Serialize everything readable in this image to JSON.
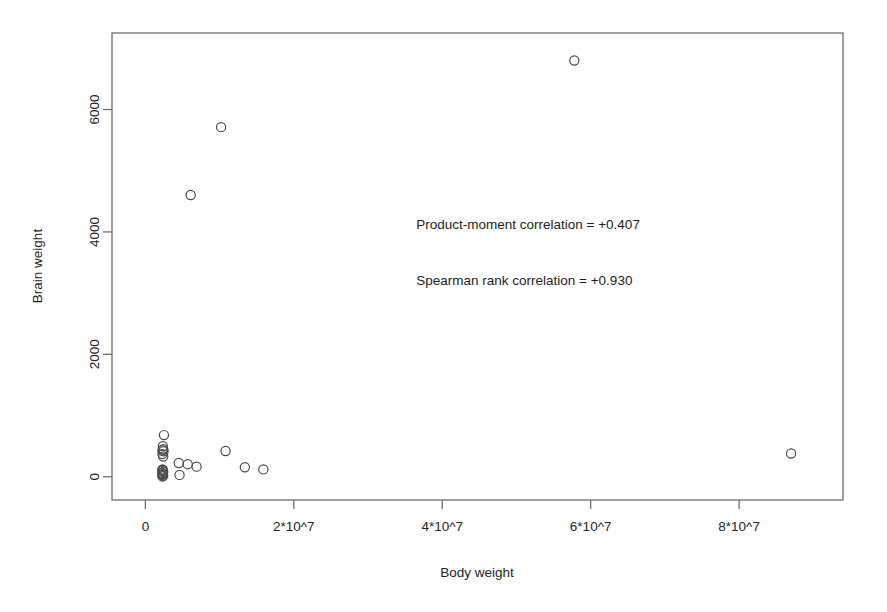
{
  "chart_data": {
    "type": "scatter",
    "title": "",
    "xlabel": "Body weight",
    "ylabel": "Brain weight",
    "xlim": [
      -4500000,
      94000000
    ],
    "ylim": [
      -380,
      7250
    ],
    "grid": false,
    "legend": null,
    "marker": {
      "shape": "open-circle",
      "radius_px": 4.6,
      "stroke": "#4a4a4a",
      "fill": "none",
      "stroke_width": 1.2
    },
    "xticks": [
      {
        "value": 0,
        "label": "0"
      },
      {
        "value": 20000000,
        "label": "2*10^7"
      },
      {
        "value": 40000000,
        "label": "4*10^7"
      },
      {
        "value": 60000000,
        "label": "6*10^7"
      },
      {
        "value": 80000000,
        "label": "8*10^7"
      }
    ],
    "yticks": [
      {
        "value": 0,
        "label": "0"
      },
      {
        "value": 2000,
        "label": "2000"
      },
      {
        "value": 4000,
        "label": "4000"
      },
      {
        "value": 6000,
        "label": "6000"
      }
    ],
    "annotations": [
      {
        "text": "Product-moment correlation = +0.407",
        "x": 36500000,
        "y": 4050,
        "anchor": "start"
      },
      {
        "text": "Spearman rank correlation = +0.930",
        "x": 36500000,
        "y": 3140,
        "anchor": "start"
      }
    ],
    "points": [
      {
        "x": 57800000,
        "y": 6800
      },
      {
        "x": 10200000,
        "y": 5712
      },
      {
        "x": 6100000,
        "y": 4603
      },
      {
        "x": 2500000,
        "y": 680
      },
      {
        "x": 2350000,
        "y": 500
      },
      {
        "x": 2400000,
        "y": 450
      },
      {
        "x": 2300000,
        "y": 430
      },
      {
        "x": 2450000,
        "y": 415
      },
      {
        "x": 2300000,
        "y": 370
      },
      {
        "x": 2400000,
        "y": 330
      },
      {
        "x": 2300000,
        "y": 120
      },
      {
        "x": 2350000,
        "y": 110
      },
      {
        "x": 2300000,
        "y": 95
      },
      {
        "x": 2400000,
        "y": 80
      },
      {
        "x": 2300000,
        "y": 60
      },
      {
        "x": 2350000,
        "y": 45
      },
      {
        "x": 2300000,
        "y": 30
      },
      {
        "x": 2400000,
        "y": 15
      },
      {
        "x": 2300000,
        "y": 5
      },
      {
        "x": 4500000,
        "y": 225
      },
      {
        "x": 5700000,
        "y": 205
      },
      {
        "x": 6900000,
        "y": 165
      },
      {
        "x": 4600000,
        "y": 30
      },
      {
        "x": 10800000,
        "y": 420
      },
      {
        "x": 13400000,
        "y": 155
      },
      {
        "x": 15900000,
        "y": 120
      },
      {
        "x": 87000000,
        "y": 380
      }
    ]
  }
}
